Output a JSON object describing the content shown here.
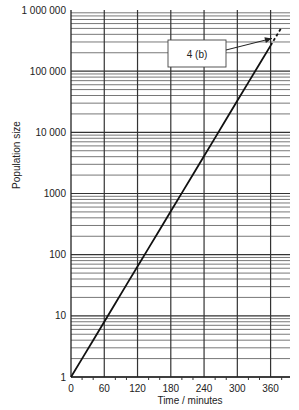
{
  "chart_data": {
    "type": "line",
    "title": "",
    "xlabel": "Time / minutes",
    "ylabel": "Population size",
    "xlim": [
      0,
      395
    ],
    "ylim": [
      1,
      1000000
    ],
    "yscale": "log",
    "grid": true,
    "x_ticks": [
      0,
      60,
      120,
      180,
      240,
      300,
      360
    ],
    "x_tick_labels": [
      "0",
      "60",
      "120",
      "180",
      "240",
      "300",
      "360"
    ],
    "x_minor_ticks": [
      20,
      40,
      80,
      100,
      140,
      160,
      200,
      220,
      260,
      280,
      320,
      340,
      380
    ],
    "y_ticks": [
      1,
      10,
      100,
      1000,
      10000,
      100000,
      1000000
    ],
    "y_tick_labels": [
      "1",
      "10",
      "100",
      "1000",
      "10 000",
      "100 000",
      "1 000 000"
    ],
    "series": [
      {
        "name": "population",
        "style": "solid",
        "x": [
          0,
          20,
          40,
          60,
          80,
          100,
          120,
          140,
          160,
          180,
          200,
          220,
          240,
          260,
          280,
          300,
          320,
          340,
          360
        ],
        "y": [
          1,
          2,
          4,
          8,
          16,
          32,
          64,
          128,
          256,
          512,
          1024,
          2048,
          4096,
          8192,
          16384,
          32768,
          65536,
          131072,
          262144
        ]
      },
      {
        "name": "extrapolation",
        "style": "dashed",
        "x": [
          360,
          380
        ],
        "y": [
          262144,
          524288
        ]
      }
    ],
    "annotations": [
      {
        "text": "4 (b)",
        "points_to": {
          "x": 366,
          "y": 330000
        }
      }
    ]
  }
}
